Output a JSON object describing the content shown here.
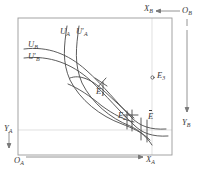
{
  "figure": {
    "type": "edgeworth-box-diagram",
    "title": "",
    "box": {
      "left": 18,
      "top": 18,
      "right": 172,
      "bottom": 155
    },
    "colors": {
      "frame": "#9a9a9a",
      "gridline": "#cfcfcf",
      "curve": "#4a4a4a",
      "text": "#3a3a3a",
      "background": "#ffffff"
    }
  },
  "axes": {
    "origin_a": {
      "label": "O",
      "sub": "A",
      "x": 14,
      "y": 160
    },
    "origin_b": {
      "label": "O",
      "sub": "B",
      "x": 184,
      "y": 11
    },
    "x_a": {
      "label": "X",
      "sub": "A",
      "x": 146,
      "y": 160,
      "arrow": "right"
    },
    "x_b": {
      "label": "X",
      "sub": "B",
      "x": 146,
      "y": 6,
      "arrow": "left"
    },
    "y_a": {
      "label": "Y",
      "sub": "A",
      "x": 5,
      "y": 127,
      "arrow": "down"
    },
    "y_b": {
      "label": "Y",
      "sub": "B",
      "x": 184,
      "y": 121,
      "arrow": "down"
    }
  },
  "curves": [
    {
      "name": "U_A",
      "label": "U",
      "sub": "A",
      "prime": false,
      "label_x": 62,
      "label_y": 31
    },
    {
      "name": "U_A_prime",
      "label": "U",
      "sub": "A",
      "prime": true,
      "label_x": 79,
      "label_y": 31
    },
    {
      "name": "U_B",
      "label": "U",
      "sub": "B",
      "prime": false,
      "label_x": 30,
      "label_y": 44
    },
    {
      "name": "U_B_prime",
      "label": "U",
      "sub": "B",
      "prime": true,
      "label_x": 30,
      "label_y": 56
    }
  ],
  "points": [
    {
      "name": "E1",
      "label": "E",
      "sub": "1",
      "bar": false,
      "marker": "tangency",
      "x": 101,
      "y": 88,
      "label_x": 98,
      "label_y": 90
    },
    {
      "name": "E2",
      "label": "E",
      "sub": "2",
      "bar": false,
      "marker": "tangency",
      "x": 131,
      "y": 119,
      "label_x": 120,
      "label_y": 114
    },
    {
      "name": "E_bar",
      "label": "E",
      "sub": "",
      "bar": true,
      "marker": "crossing",
      "x": 145,
      "y": 128,
      "label_x": 148,
      "label_y": 115
    },
    {
      "name": "E3",
      "label": "E",
      "sub": "3",
      "bar": false,
      "marker": "open-circle",
      "x": 152,
      "y": 78,
      "label_x": 157,
      "label_y": 73
    }
  ],
  "gridlines": {
    "vertical_x": 152,
    "horizontal_y": 130
  }
}
